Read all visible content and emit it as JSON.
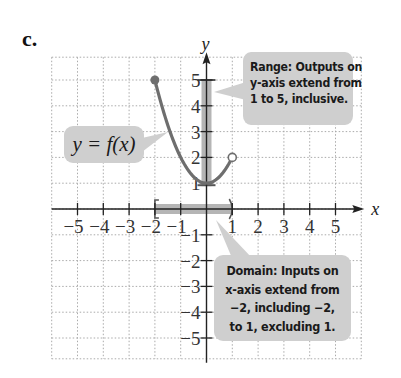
{
  "part_label": "c.",
  "function_label": "y = f(x)",
  "range_callout": {
    "lines": [
      "Range: Outputs on",
      "y-axis extend from",
      "1 to 5, inclusive."
    ]
  },
  "domain_callout": {
    "lines": [
      "Domain: Inputs on",
      "x-axis extend from",
      "−2, including −2,",
      "to 1, excluding 1."
    ]
  },
  "colors": {
    "curve": "#6e6e6e",
    "callout_bg": "#cfcfcf",
    "highlight": "#b5b5b5",
    "grid": "#aaaaaa",
    "axis": "#222222"
  },
  "chart_data": {
    "type": "line",
    "title": "",
    "xlabel": "x",
    "ylabel": "y",
    "xlim": [
      -6,
      6
    ],
    "ylim": [
      -6,
      6
    ],
    "grid": true,
    "x_ticks": [
      -5,
      -4,
      -3,
      -2,
      -1,
      1,
      2,
      3,
      4,
      5
    ],
    "y_ticks": [
      -5,
      -4,
      -3,
      -2,
      -1,
      1,
      2,
      3,
      4,
      5
    ],
    "series": [
      {
        "name": "y = f(x)",
        "function": "x^2 + 1",
        "domain": [
          -2,
          1
        ],
        "x": [
          -2,
          -1.5,
          -1,
          -0.5,
          0,
          0.5,
          1
        ],
        "y": [
          5,
          3.25,
          2,
          1.25,
          1,
          1.25,
          2
        ],
        "start_point": {
          "x": -2,
          "y": 5,
          "closed": true
        },
        "end_point": {
          "x": 1,
          "y": 2,
          "closed": false
        }
      }
    ],
    "domain_interval": {
      "from": -2,
      "to": 1,
      "left": "[",
      "right": ")"
    },
    "range_interval": {
      "from": 1,
      "to": 5,
      "inclusive": true
    }
  }
}
